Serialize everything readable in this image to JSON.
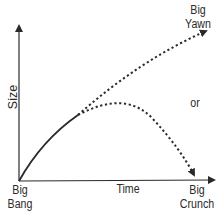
{
  "diagram": {
    "type": "cosmology-fate-diagram",
    "axes": {
      "y_label": "Size",
      "x_label": "Time"
    },
    "labels": {
      "origin_line1": "Big",
      "origin_line2": "Bang",
      "upper_end_line1": "Big",
      "upper_end_line2": "Yawn",
      "lower_end_line1": "Big",
      "lower_end_line2": "Crunch",
      "connector": "or"
    },
    "curves": [
      {
        "name": "expansion",
        "style": "solid"
      },
      {
        "name": "big-yawn-path",
        "style": "dotted",
        "direction": "rises-forever"
      },
      {
        "name": "big-crunch-path",
        "style": "dotted",
        "direction": "peaks-then-collapses"
      }
    ],
    "colors": {
      "ink": "#2a2a2a",
      "background": "#ffffff"
    }
  }
}
